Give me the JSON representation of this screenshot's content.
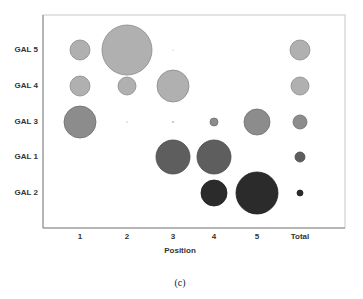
{
  "chart_data": {
    "type": "bubble",
    "title": "",
    "xlabel": "Position",
    "ylabel": "",
    "caption": "(c)",
    "categories": [
      "1",
      "2",
      "3",
      "4",
      "5",
      "Total"
    ],
    "rows": [
      "GAL 5",
      "GAL 4",
      "GAL 3",
      "GAL 1",
      "GAL 2"
    ],
    "grid": false,
    "legend": null,
    "series": [
      {
        "name": "GAL 5",
        "color": "#b0b0b0",
        "radii": [
          10,
          25,
          0.6,
          0,
          0,
          10
        ]
      },
      {
        "name": "GAL 4",
        "color": "#b0b0b0",
        "radii": [
          10,
          9,
          16,
          0,
          0,
          9
        ]
      },
      {
        "name": "GAL 3",
        "color": "#8c8c8c",
        "radii": [
          16,
          0.6,
          0.8,
          4,
          13,
          7
        ]
      },
      {
        "name": "GAL 1",
        "color": "#5e5e5e",
        "radii": [
          0,
          0,
          17,
          17,
          0,
          5
        ]
      },
      {
        "name": "GAL 2",
        "color": "#2b2b2b",
        "radii": [
          0,
          0,
          0,
          13,
          21,
          3
        ]
      }
    ]
  },
  "layout": {
    "plot": {
      "left": 43,
      "top": 15,
      "right": 345,
      "bottom": 228
    },
    "x_centers": [
      80,
      127,
      173,
      214,
      257,
      300
    ],
    "y_centers": [
      50,
      86,
      122,
      157,
      193
    ],
    "stroke_colors": {
      "#b0b0b0": "#8a8a8a",
      "#8c8c8c": "#6e6e6e",
      "#5e5e5e": "#4a4a4a",
      "#2b2b2b": "#1e1e1e"
    }
  }
}
